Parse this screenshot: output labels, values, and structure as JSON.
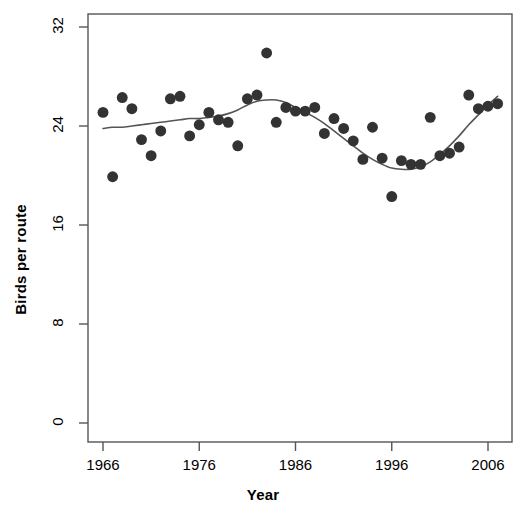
{
  "chart_data": {
    "type": "scatter",
    "title": "",
    "subtitle": "",
    "xlabel": "Year",
    "ylabel": "Birds per route",
    "xlim": [
      1964.5,
      2008.5
    ],
    "ylim": [
      0,
      33
    ],
    "xticks": [
      1966,
      1976,
      1986,
      1996,
      2006
    ],
    "xticklabels": [
      "1966",
      "1976",
      "1986",
      "1996",
      "2006"
    ],
    "yticks": [
      0,
      8,
      16,
      24,
      32
    ],
    "yticklabels": [
      "0",
      "8",
      "16",
      "24",
      "32"
    ],
    "grid": false,
    "legend": null,
    "point_color": "#333333",
    "point_size": 6.5,
    "line_color": "#555555",
    "line_width": 1.6,
    "box_color": "#555555",
    "x": [
      1966,
      1967,
      1968,
      1969,
      1970,
      1971,
      1972,
      1973,
      1974,
      1975,
      1976,
      1977,
      1978,
      1979,
      1980,
      1981,
      1982,
      1983,
      1984,
      1985,
      1986,
      1987,
      1988,
      1989,
      1990,
      1991,
      1992,
      1993,
      1994,
      1995,
      1996,
      1997,
      1998,
      1999,
      2000,
      2001,
      2002,
      2003,
      2004,
      2005,
      2006,
      2007
    ],
    "y": [
      25.1,
      19.9,
      26.3,
      25.4,
      22.9,
      21.6,
      23.6,
      26.2,
      26.4,
      23.2,
      24.1,
      25.1,
      24.5,
      24.3,
      22.4,
      26.2,
      26.5,
      29.9,
      24.3,
      25.5,
      25.2,
      25.2,
      25.5,
      23.4,
      24.6,
      23.8,
      22.8,
      21.3,
      23.9,
      21.4,
      18.3,
      21.2,
      20.9,
      20.9,
      24.7,
      21.6,
      21.8,
      22.3,
      26.5,
      25.4,
      25.6,
      25.8
    ],
    "series": [
      {
        "name": "Birds per route",
        "type": "points",
        "values": [
          25.1,
          19.9,
          26.3,
          25.4,
          22.9,
          21.6,
          23.6,
          26.2,
          26.4,
          23.2,
          24.1,
          25.1,
          24.5,
          24.3,
          22.4,
          26.2,
          26.5,
          29.9,
          24.3,
          25.5,
          25.2,
          25.2,
          25.5,
          23.4,
          24.6,
          23.8,
          22.8,
          21.3,
          23.9,
          21.4,
          18.3,
          21.2,
          20.9,
          20.9,
          24.7,
          21.6,
          21.8,
          22.3,
          26.5,
          25.4,
          25.6,
          25.8
        ]
      },
      {
        "name": "smoothed trend",
        "type": "line",
        "x": [
          1966,
          1967,
          1968,
          1969,
          1970,
          1971,
          1972,
          1973,
          1974,
          1975,
          1976,
          1977,
          1978,
          1979,
          1980,
          1981,
          1982,
          1983,
          1984,
          1985,
          1986,
          1987,
          1988,
          1989,
          1990,
          1991,
          1992,
          1993,
          1994,
          1995,
          1996,
          1997,
          1998,
          1999,
          2000,
          2001,
          2002,
          2003,
          2004,
          2005,
          2006,
          2007
        ],
        "values": [
          23.8,
          23.9,
          23.9,
          24.0,
          24.1,
          24.2,
          24.3,
          24.4,
          24.5,
          24.6,
          24.6,
          24.7,
          24.8,
          25.0,
          25.3,
          25.7,
          26.0,
          26.1,
          26.1,
          25.9,
          25.5,
          25.1,
          24.7,
          24.2,
          23.6,
          23.0,
          22.4,
          21.8,
          21.3,
          20.9,
          20.6,
          20.5,
          20.5,
          20.7,
          21.1,
          21.7,
          22.4,
          23.2,
          24.1,
          24.9,
          25.7,
          26.4
        ]
      }
    ]
  },
  "axes": {
    "xlabel": "Year",
    "ylabel": "Birds per route"
  }
}
